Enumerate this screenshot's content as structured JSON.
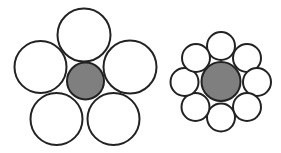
{
  "diagram": {
    "colors": {
      "background": "#ffffff",
      "stroke": "#222222",
      "core_fill": "#7f7f7f",
      "outer_fill": "#ffffff"
    },
    "stroke_width": 2,
    "figures": [
      {
        "name": "five-circle-arrangement",
        "outer_count": 5,
        "core": {
          "cx": 85.5,
          "cy": 81,
          "r": 18.5
        },
        "outer": [
          {
            "cx": 84,
            "cy": 35,
            "r": 26.5
          },
          {
            "cx": 40.5,
            "cy": 67,
            "r": 26
          },
          {
            "cx": 130,
            "cy": 67,
            "r": 26.5
          },
          {
            "cx": 56.5,
            "cy": 119,
            "r": 26
          },
          {
            "cx": 113.5,
            "cy": 119,
            "r": 26
          }
        ]
      },
      {
        "name": "eight-circle-arrangement",
        "outer_count": 8,
        "core": {
          "cx": 221,
          "cy": 81.5,
          "r": 19.5
        },
        "outer": [
          {
            "cx": 221,
            "cy": 46,
            "r": 14
          },
          {
            "cx": 247,
            "cy": 58,
            "r": 14
          },
          {
            "cx": 257,
            "cy": 82,
            "r": 14
          },
          {
            "cx": 247,
            "cy": 107,
            "r": 14
          },
          {
            "cx": 221,
            "cy": 117.5,
            "r": 14
          },
          {
            "cx": 195.5,
            "cy": 107,
            "r": 14
          },
          {
            "cx": 184.5,
            "cy": 82,
            "r": 14
          },
          {
            "cx": 196,
            "cy": 58,
            "r": 14
          }
        ]
      }
    ]
  }
}
